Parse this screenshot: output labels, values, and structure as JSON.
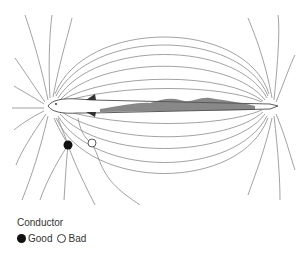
{
  "figure": {
    "line_color": "#8a8a8a"
  },
  "legend": {
    "title": "Conductor",
    "items": [
      {
        "label": "Good",
        "symbol": "filled-circle",
        "color": "#111111"
      },
      {
        "label": "Bad",
        "symbol": "open-circle",
        "color": "#333333"
      }
    ]
  }
}
